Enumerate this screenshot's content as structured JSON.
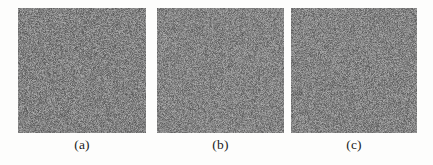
{
  "figure": {
    "kind": "image-panel-figure",
    "background_color": "#fdfdfc",
    "panel_count": 3,
    "panels": [
      {
        "id": "panel-a",
        "caption": "(a)",
        "content_type": "grayscale-noise-image",
        "mean_gray_hex": "#828282",
        "noise_amplitude": 46,
        "seed": 101,
        "x": 18,
        "y": 8,
        "width": 128,
        "height": 125
      },
      {
        "id": "panel-b",
        "caption": "(b)",
        "content_type": "grayscale-noise-image",
        "mean_gray_hex": "#848484",
        "noise_amplitude": 44,
        "seed": 202,
        "x": 157,
        "y": 8,
        "width": 127,
        "height": 125
      },
      {
        "id": "panel-c",
        "caption": "(c)",
        "content_type": "grayscale-noise-image",
        "mean_gray_hex": "#838383",
        "noise_amplitude": 45,
        "seed": 303,
        "x": 291,
        "y": 8,
        "width": 126,
        "height": 125
      }
    ]
  }
}
